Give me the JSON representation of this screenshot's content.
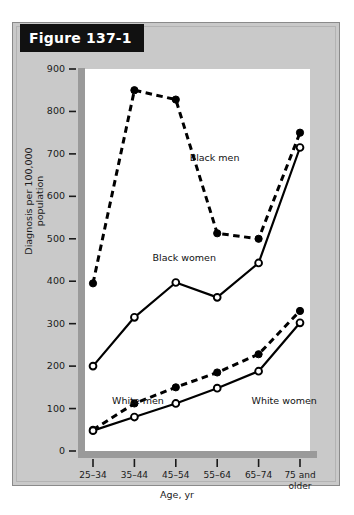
{
  "figure": {
    "banner_label": "Figure 137-1"
  },
  "chart_data": {
    "type": "line",
    "title": "Figure 137-1",
    "xlabel": "Age, yr",
    "ylabel": "Diagnosis per 100,000 population",
    "categories": [
      "25–34",
      "35–44",
      "45–54",
      "55–64",
      "65–74",
      "75 and older"
    ],
    "ylim": [
      0,
      900
    ],
    "yticks": [
      0,
      100,
      200,
      300,
      400,
      500,
      600,
      700,
      800,
      900
    ],
    "ytick_labels": [
      "0",
      "100",
      "200",
      "300",
      "400",
      "500",
      "600",
      "700",
      "800",
      "900"
    ],
    "grid": false,
    "legend": "inline-annotations",
    "series": [
      {
        "name": "Black men",
        "style": "dashed",
        "marker": "filled-circle",
        "color": "#000000",
        "values": [
          395,
          850,
          828,
          513,
          500,
          750
        ]
      },
      {
        "name": "Black women",
        "style": "solid",
        "marker": "open-circle",
        "color": "#000000",
        "values": [
          200,
          315,
          397,
          362,
          443,
          715
        ]
      },
      {
        "name": "White men",
        "style": "dashed",
        "marker": "filled-circle",
        "color": "#000000",
        "values": [
          50,
          112,
          150,
          185,
          228,
          330
        ]
      },
      {
        "name": "White women",
        "style": "solid",
        "marker": "open-circle",
        "color": "#000000",
        "values": [
          48,
          80,
          112,
          148,
          188,
          302
        ]
      }
    ],
    "annotations": [
      {
        "text": "Black men",
        "x_frac": 0.465,
        "y_value": 690
      },
      {
        "text": "Black women",
        "x_frac": 0.3,
        "y_value": 455
      },
      {
        "text": "White men",
        "x_frac": 0.12,
        "y_value": 118
      },
      {
        "text": "White women",
        "x_frac": 0.74,
        "y_value": 118
      }
    ]
  }
}
